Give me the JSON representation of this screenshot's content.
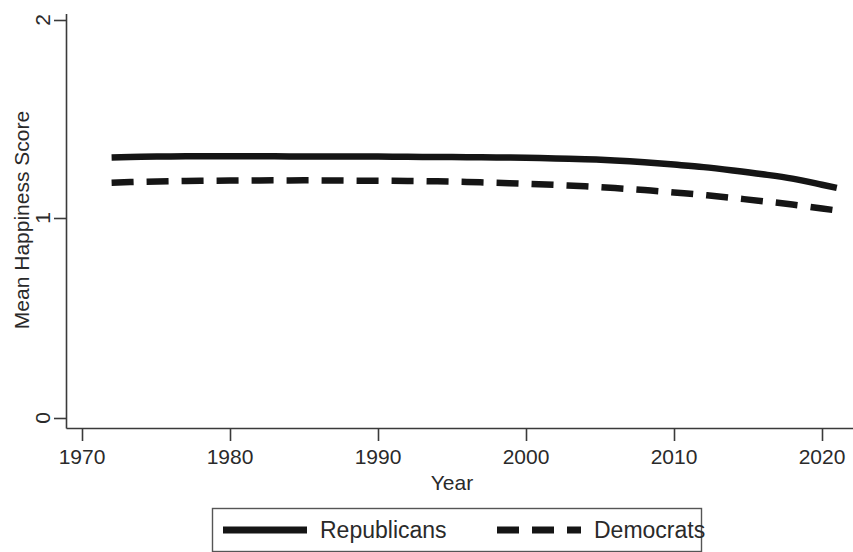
{
  "chart_data": {
    "type": "line",
    "title": "",
    "xlabel": "Year",
    "ylabel": "Mean Happiness Score",
    "xlim": [
      1968,
      2023
    ],
    "ylim": [
      0,
      2
    ],
    "xticks": [
      1970,
      1980,
      1990,
      2000,
      2010,
      2020
    ],
    "xtick_labels": [
      "1970",
      "1980",
      "1990",
      "2000",
      "2010",
      "2020"
    ],
    "yticks": [
      0,
      1,
      2
    ],
    "ytick_labels": [
      "0",
      "1",
      "2"
    ],
    "grid": false,
    "legend_position": "bottom-outside",
    "x": [
      1972,
      1974,
      1976,
      1978,
      1980,
      1982,
      1984,
      1986,
      1988,
      1990,
      1992,
      1994,
      1996,
      1998,
      2000,
      2002,
      2004,
      2006,
      2008,
      2010,
      2012,
      2014,
      2016,
      2018,
      2020,
      2021
    ],
    "series": [
      {
        "name": "Republicans",
        "style": "solid",
        "color": "#151515",
        "values": [
          1.305,
          1.309,
          1.311,
          1.312,
          1.312,
          1.312,
          1.311,
          1.311,
          1.31,
          1.31,
          1.309,
          1.308,
          1.307,
          1.306,
          1.304,
          1.301,
          1.297,
          1.291,
          1.282,
          1.27,
          1.257,
          1.24,
          1.221,
          1.199,
          1.168,
          1.152
        ]
      },
      {
        "name": "Democrats",
        "style": "dashed",
        "color": "#151515",
        "values": [
          1.178,
          1.183,
          1.186,
          1.188,
          1.189,
          1.19,
          1.19,
          1.19,
          1.189,
          1.188,
          1.187,
          1.185,
          1.182,
          1.178,
          1.173,
          1.167,
          1.16,
          1.151,
          1.141,
          1.129,
          1.116,
          1.101,
          1.085,
          1.068,
          1.048,
          1.038
        ]
      }
    ]
  },
  "axes": {
    "y_title": "Mean Happiness Score",
    "x_title": "Year",
    "y_tick_0": "0",
    "y_tick_1": "1",
    "y_tick_2": "2",
    "x_tick_1970": "1970",
    "x_tick_1980": "1980",
    "x_tick_1990": "1990",
    "x_tick_2000": "2000",
    "x_tick_2010": "2010",
    "x_tick_2020": "2020"
  },
  "legend": {
    "items": [
      {
        "label": "Republicans",
        "style": "solid"
      },
      {
        "label": "Democrats",
        "style": "dashed"
      }
    ]
  }
}
